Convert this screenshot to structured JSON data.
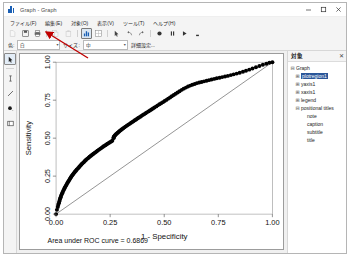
{
  "window": {
    "title": "Graph - Graph",
    "app_icon": "bar-chart-icon",
    "minimize": "—",
    "maximize": "□",
    "close": "✕"
  },
  "menubar": {
    "items": [
      {
        "name": "file",
        "label": "ファイル(F)"
      },
      {
        "name": "edit",
        "label": "編集(E)"
      },
      {
        "name": "object",
        "label": "対象(O)"
      },
      {
        "name": "view",
        "label": "表示(V)"
      },
      {
        "name": "tools",
        "label": "ツール(T)"
      },
      {
        "name": "help",
        "label": "ヘルプ(H)"
      }
    ]
  },
  "toolbar": {
    "buttons": [
      {
        "name": "new",
        "icon": "page-icon",
        "state": "disabled"
      },
      {
        "name": "save",
        "icon": "save-icon",
        "state": "normal"
      },
      {
        "name": "print",
        "icon": "print-icon",
        "state": "normal"
      },
      {
        "name": "copy",
        "icon": "copy-icon",
        "state": "disabled"
      },
      {
        "name": "paste",
        "icon": "paste-icon",
        "state": "disabled"
      },
      {
        "name": "graph-editor",
        "icon": "bar-chart-icon",
        "state": "selected"
      },
      {
        "name": "grid-edit",
        "icon": "grid-icon",
        "state": "normal"
      },
      {
        "name": "pointer",
        "icon": "pointer-icon",
        "state": "normal"
      },
      {
        "name": "undo",
        "icon": "undo-icon",
        "state": "normal"
      },
      {
        "name": "redo",
        "icon": "redo-icon",
        "state": "normal"
      },
      {
        "name": "record",
        "icon": "record-icon",
        "state": "normal"
      },
      {
        "name": "pause",
        "icon": "pause-icon",
        "state": "normal"
      },
      {
        "name": "play",
        "icon": "play-icon",
        "state": "normal"
      },
      {
        "name": "stop",
        "icon": "stop-icon",
        "state": "normal"
      }
    ]
  },
  "toolbar2": {
    "color_label": "色:",
    "color_value": "白",
    "size_label": "サイズ:",
    "size_value": "中",
    "more_label": "詳細設定...",
    "dropdown_arrow": "▾"
  },
  "left_tools": {
    "buttons": [
      {
        "name": "select-pointer",
        "icon": "pointer-icon",
        "state": "selected"
      },
      {
        "name": "add-text",
        "icon": "text-cursor-icon",
        "state": "normal"
      },
      {
        "name": "add-line",
        "icon": "line-icon",
        "state": "normal"
      },
      {
        "name": "add-marker",
        "icon": "marker-dot-icon",
        "state": "normal"
      },
      {
        "name": "add-box",
        "icon": "rectangle-icon",
        "state": "normal"
      }
    ]
  },
  "object_panel": {
    "title": "対象",
    "close": "✕",
    "tree": [
      {
        "label": "Graph",
        "depth": 1,
        "expander": "⊟",
        "selected": false
      },
      {
        "label": "plotregion1",
        "depth": 2,
        "expander": "⊞",
        "selected": true
      },
      {
        "label": "yaxis1",
        "depth": 2,
        "expander": "⊞",
        "selected": false
      },
      {
        "label": "xaxis1",
        "depth": 2,
        "expander": "⊞",
        "selected": false
      },
      {
        "label": "legend",
        "depth": 2,
        "expander": "⊞",
        "selected": false
      },
      {
        "label": "positional titles",
        "depth": 2,
        "expander": "⊟",
        "selected": false
      },
      {
        "label": "note",
        "depth": 3,
        "expander": "",
        "selected": false
      },
      {
        "label": "caption",
        "depth": 3,
        "expander": "",
        "selected": false
      },
      {
        "label": "subtitle",
        "depth": 3,
        "expander": "",
        "selected": false
      },
      {
        "label": "title",
        "depth": 3,
        "expander": "",
        "selected": false
      }
    ]
  },
  "chart_data": {
    "type": "line",
    "title": "",
    "xlabel": "1 - Specificity",
    "ylabel": "Sensitivity",
    "caption": "Area under ROC curve = 0.6869",
    "auc": 0.6869,
    "xlim": [
      0,
      1
    ],
    "ylim": [
      0,
      1
    ],
    "xticks": [
      0,
      0.25,
      0.5,
      0.75,
      1
    ],
    "xticklabels": [
      "0.00",
      "0.25",
      "0.50",
      "0.75",
      "1.00"
    ],
    "yticks": [
      0,
      0.25,
      0.5,
      0.75,
      1
    ],
    "yticklabels": [
      "0.00",
      "0.25",
      "0.50",
      "0.75",
      "1.00"
    ],
    "grid": false,
    "legend": "none",
    "marker_color": "#000000",
    "reference_line_color": "#555555",
    "series": [
      {
        "name": "ROC curve",
        "style": "markers",
        "x": [
          0.0,
          0.004,
          0.008,
          0.01,
          0.013,
          0.015,
          0.017,
          0.019,
          0.021,
          0.023,
          0.026,
          0.028,
          0.031,
          0.033,
          0.036,
          0.039,
          0.041,
          0.044,
          0.047,
          0.05,
          0.053,
          0.056,
          0.059,
          0.062,
          0.065,
          0.068,
          0.071,
          0.074,
          0.078,
          0.081,
          0.085,
          0.088,
          0.092,
          0.095,
          0.099,
          0.103,
          0.107,
          0.11,
          0.114,
          0.118,
          0.122,
          0.126,
          0.13,
          0.134,
          0.138,
          0.142,
          0.147,
          0.151,
          0.155,
          0.16,
          0.164,
          0.169,
          0.173,
          0.178,
          0.183,
          0.188,
          0.192,
          0.197,
          0.202,
          0.207,
          0.212,
          0.217,
          0.222,
          0.228,
          0.233,
          0.238,
          0.244,
          0.249,
          0.255,
          0.26,
          0.266,
          0.266,
          0.268,
          0.271,
          0.274,
          0.277,
          0.281,
          0.285,
          0.289,
          0.293,
          0.297,
          0.302,
          0.306,
          0.311,
          0.316,
          0.321,
          0.326,
          0.331,
          0.336,
          0.342,
          0.347,
          0.353,
          0.358,
          0.364,
          0.37,
          0.376,
          0.382,
          0.388,
          0.394,
          0.401,
          0.407,
          0.414,
          0.42,
          0.427,
          0.434,
          0.441,
          0.448,
          0.455,
          0.463,
          0.47,
          0.478,
          0.486,
          0.494,
          0.502,
          0.51,
          0.518,
          0.527,
          0.535,
          0.544,
          0.553,
          0.562,
          0.571,
          0.581,
          0.59,
          0.6,
          0.61,
          0.62,
          0.63,
          0.641,
          0.651,
          0.662,
          0.673,
          0.684,
          0.696,
          0.707,
          0.719,
          0.731,
          0.743,
          0.756,
          0.768,
          0.781,
          0.794,
          0.808,
          0.821,
          0.835,
          0.849,
          0.864,
          0.878,
          0.893,
          0.908,
          0.924,
          0.94,
          0.956,
          0.972,
          0.986,
          1.0
        ],
        "y": [
          0.0,
          0.028,
          0.047,
          0.06,
          0.072,
          0.083,
          0.093,
          0.102,
          0.111,
          0.12,
          0.129,
          0.137,
          0.145,
          0.153,
          0.161,
          0.169,
          0.176,
          0.184,
          0.191,
          0.199,
          0.206,
          0.213,
          0.22,
          0.227,
          0.234,
          0.241,
          0.248,
          0.254,
          0.261,
          0.267,
          0.274,
          0.28,
          0.286,
          0.292,
          0.298,
          0.304,
          0.31,
          0.316,
          0.322,
          0.328,
          0.334,
          0.339,
          0.345,
          0.351,
          0.356,
          0.362,
          0.367,
          0.372,
          0.378,
          0.383,
          0.388,
          0.393,
          0.398,
          0.403,
          0.408,
          0.413,
          0.418,
          0.423,
          0.428,
          0.433,
          0.438,
          0.443,
          0.448,
          0.453,
          0.458,
          0.463,
          0.468,
          0.473,
          0.478,
          0.483,
          0.5,
          0.506,
          0.511,
          0.516,
          0.521,
          0.526,
          0.531,
          0.536,
          0.541,
          0.546,
          0.551,
          0.556,
          0.561,
          0.566,
          0.571,
          0.576,
          0.581,
          0.586,
          0.591,
          0.596,
          0.602,
          0.607,
          0.612,
          0.618,
          0.623,
          0.629,
          0.634,
          0.64,
          0.646,
          0.652,
          0.658,
          0.664,
          0.67,
          0.676,
          0.682,
          0.689,
          0.695,
          0.702,
          0.709,
          0.716,
          0.723,
          0.73,
          0.737,
          0.745,
          0.752,
          0.76,
          0.768,
          0.776,
          0.784,
          0.792,
          0.801,
          0.809,
          0.818,
          0.826,
          0.833,
          0.84,
          0.846,
          0.852,
          0.857,
          0.862,
          0.866,
          0.87,
          0.874,
          0.878,
          0.882,
          0.886,
          0.89,
          0.894,
          0.898,
          0.902,
          0.906,
          0.91,
          0.915,
          0.92,
          0.925,
          0.931,
          0.937,
          0.944,
          0.951,
          0.959,
          0.967,
          0.975,
          0.983,
          0.99,
          0.996,
          1.0
        ]
      },
      {
        "name": "Reference line",
        "style": "line",
        "x": [
          0,
          1
        ],
        "y": [
          0,
          1
        ]
      }
    ]
  }
}
